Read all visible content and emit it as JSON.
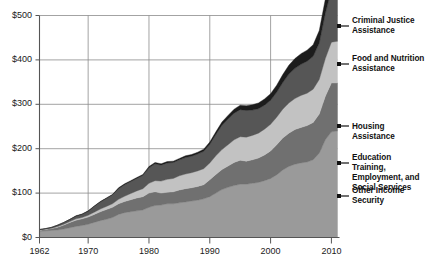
{
  "chart_data": {
    "type": "area",
    "stacked": true,
    "title": "",
    "subtitle": "",
    "xlabel": "",
    "ylabel": "",
    "xlim": [
      1962,
      2011
    ],
    "ylim": [
      0,
      500
    ],
    "grid": true,
    "legend_position": "right",
    "y_ticks": [
      "$0",
      "$100",
      "$200",
      "$300",
      "$400",
      "$500"
    ],
    "y_tick_values": [
      0,
      100,
      200,
      300,
      400,
      500
    ],
    "x_ticks": [
      "1962",
      "1970",
      "1980",
      "1990",
      "2000",
      "2010"
    ],
    "x_tick_values": [
      1962,
      1970,
      1980,
      1990,
      2000,
      2010
    ],
    "x": [
      1962,
      1963,
      1964,
      1965,
      1966,
      1967,
      1968,
      1969,
      1970,
      1971,
      1972,
      1973,
      1974,
      1975,
      1976,
      1977,
      1978,
      1979,
      1980,
      1981,
      1982,
      1983,
      1984,
      1985,
      1986,
      1987,
      1988,
      1989,
      1990,
      1991,
      1992,
      1993,
      1994,
      1995,
      1996,
      1997,
      1998,
      1999,
      2000,
      2001,
      2002,
      2003,
      2004,
      2005,
      2006,
      2007,
      2008,
      2009,
      2010,
      2011
    ],
    "series": [
      {
        "name": "Other Income Security",
        "color": "#9a9a9a",
        "values": [
          14,
          15,
          16,
          17,
          19,
          22,
          25,
          27,
          30,
          34,
          38,
          41,
          45,
          52,
          56,
          58,
          60,
          62,
          68,
          72,
          73,
          76,
          76,
          78,
          80,
          82,
          84,
          87,
          92,
          100,
          108,
          113,
          117,
          120,
          120,
          122,
          124,
          128,
          133,
          141,
          152,
          160,
          165,
          168,
          170,
          175,
          190,
          220,
          238,
          240
        ]
      },
      {
        "name": "Education Training, Employment, and Social Services",
        "color": "#707070",
        "values": [
          2,
          3,
          4,
          6,
          9,
          12,
          14,
          15,
          16,
          18,
          20,
          22,
          23,
          24,
          25,
          27,
          29,
          30,
          32,
          31,
          27,
          26,
          27,
          29,
          30,
          30,
          31,
          32,
          38,
          42,
          45,
          48,
          52,
          54,
          52,
          53,
          55,
          58,
          62,
          68,
          72,
          75,
          78,
          80,
          82,
          84,
          88,
          98,
          110,
          108
        ]
      },
      {
        "name": "Housing Assistance",
        "color": "#c2c2c2",
        "values": [
          1,
          1,
          1,
          2,
          2,
          2,
          3,
          3,
          4,
          5,
          6,
          7,
          8,
          10,
          12,
          14,
          16,
          18,
          22,
          25,
          27,
          29,
          30,
          32,
          33,
          34,
          35,
          36,
          38,
          42,
          45,
          48,
          51,
          53,
          54,
          55,
          56,
          58,
          60,
          62,
          65,
          68,
          70,
          72,
          73,
          75,
          78,
          85,
          92,
          94
        ]
      },
      {
        "name": "Food and Nutrition Assistance",
        "color": "#565656",
        "values": [
          1,
          1,
          2,
          3,
          4,
          5,
          6,
          7,
          9,
          13,
          16,
          18,
          20,
          24,
          26,
          27,
          28,
          30,
          35,
          38,
          36,
          37,
          36,
          36,
          37,
          37,
          38,
          39,
          42,
          48,
          55,
          58,
          60,
          61,
          60,
          57,
          55,
          54,
          54,
          56,
          60,
          65,
          68,
          70,
          72,
          74,
          82,
          102,
          118,
          120
        ]
      },
      {
        "name": "Criminal Justice Assistance",
        "color": "#1c1c1c",
        "values": [
          0,
          0,
          0,
          0,
          0,
          0,
          1,
          1,
          1,
          1,
          1,
          1,
          1,
          2,
          2,
          2,
          2,
          2,
          3,
          3,
          3,
          3,
          3,
          3,
          4,
          4,
          4,
          5,
          5,
          6,
          7,
          8,
          9,
          10,
          11,
          12,
          13,
          14,
          15,
          16,
          18,
          20,
          22,
          24,
          25,
          26,
          28,
          32,
          36,
          35
        ]
      }
    ]
  },
  "axis": {
    "y_labels": [
      "$500",
      "$400",
      "$300",
      "$200",
      "$100",
      "$0"
    ],
    "x_labels": [
      "1962",
      "1970",
      "1980",
      "1990",
      "2000",
      "2010"
    ]
  },
  "legend": {
    "items": [
      {
        "label": "Criminal Justice\nAssistance"
      },
      {
        "label": "Food and Nutrition\nAssistance"
      },
      {
        "label": "Housing Assistance"
      },
      {
        "label": "Education Training,\nEmployment, and\nSocial Services"
      },
      {
        "label": "Other Income\nSecurity"
      }
    ]
  }
}
